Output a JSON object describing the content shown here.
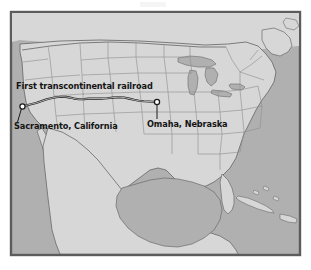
{
  "figure": {
    "kind": "reference-map",
    "caption": "",
    "frame": {
      "x": 11,
      "y": 12,
      "width": 289,
      "height": 243
    }
  },
  "colors": {
    "page_background": "#ffffff",
    "frame_border": "#5c5c5c",
    "water": "#b0b0b0",
    "land": "#d7d7d7",
    "state_border": "#8f8f8f",
    "country_border": "#6a6a6a",
    "railroad_line": "#1a1a1a",
    "label_text": "#141414",
    "city_marker_fill": "#ffffff",
    "city_marker_stroke": "#1a1a1a"
  },
  "labels": [
    {
      "id": "railroad",
      "text": "First transcontinental railroad",
      "x": 16,
      "y": 89,
      "anchor": "start"
    },
    {
      "id": "sacramento",
      "text": "Sacramento, California",
      "x": 14,
      "y": 129,
      "anchor": "start"
    },
    {
      "id": "omaha",
      "text": "Omaha, Nebraska",
      "x": 147,
      "y": 127,
      "anchor": "start"
    }
  ],
  "cities": [
    {
      "name": "Sacramento",
      "state": "California",
      "marker": {
        "x": 22.5,
        "y": 106.5,
        "r": 2.6
      },
      "leader": {
        "x1": 21.5,
        "y1": 108.5,
        "x2": 17.5,
        "y2": 122.0
      }
    },
    {
      "name": "Omaha",
      "state": "Nebraska",
      "marker": {
        "x": 157.0,
        "y": 102.0,
        "r": 2.6
      },
      "leader": {
        "x1": 157.0,
        "y1": 104.5,
        "x2": 157.0,
        "y2": 119.0
      }
    }
  ],
  "railroad": {
    "name": "First transcontinental railroad",
    "from": "Sacramento, California",
    "to": "Omaha, Nebraska",
    "stroke_width": 2.1,
    "path": "M 22.5 106.5 L 30 104.4 L 36 103.0 L 41 101.3 L 46 99.6 L 51 98.3 L 56 97.2 L 61 96.7 L 66 96.9 L 70 97.6 L 74 98.6 L 79 99.3 L 84 99.1 L 89 98.6 L 95 98.5 L 101 98.6 L 107 98.3 L 113 97.6 L 119 97.2 L 124 97.5 L 129 98.6 L 134 99.8 L 139 100.8 L 144 101.3 L 149 101.5 L 153 101.7 L 157 102.0"
  },
  "water_bodies": [
    "Pacific Ocean",
    "Atlantic Ocean",
    "Gulf of Mexico",
    "Great Lakes",
    "Caribbean Sea",
    "Hudson Bay outlet"
  ],
  "regions": [
    "United States",
    "Canada",
    "Mexico",
    "Cuba",
    "Bahamas",
    "Hispaniola"
  ]
}
